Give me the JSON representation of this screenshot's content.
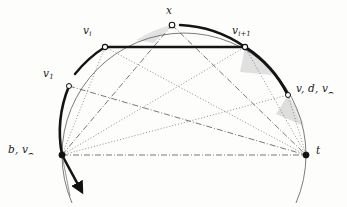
{
  "figure": {
    "kind": "geometric-diagram",
    "colors": {
      "stroke": "#1b1b1b",
      "thin_arc": "#4a4a4a",
      "bold_path": "#111111",
      "dotted_line": "#555555",
      "dashdot_line": "#3c3c3c",
      "shade_fill": "#d9d9d9",
      "background": "#fdfdfc"
    },
    "labels": [
      {
        "id": "x",
        "text": "x",
        "sub": "",
        "x": 170,
        "y": 6,
        "anchor": "center"
      },
      {
        "id": "vi",
        "text": "v",
        "sub": "i",
        "x": 88,
        "y": 27,
        "anchor": "center"
      },
      {
        "id": "vi1",
        "text": "v",
        "sub": "i+1",
        "x": 240,
        "y": 27,
        "anchor": "center"
      },
      {
        "id": "v1",
        "text": "v",
        "sub": "1",
        "x": 48,
        "y": 70,
        "anchor": "center"
      },
      {
        "id": "vdv",
        "text": "v, d, v",
        "sub": "cap",
        "x": 296,
        "y": 85,
        "anchor": "left"
      },
      {
        "id": "bv",
        "text": "b, v",
        "sub": "cap",
        "x": 8,
        "y": 146,
        "anchor": "left"
      },
      {
        "id": "t",
        "text": "t",
        "sub": "",
        "x": 317,
        "y": 146,
        "anchor": "left"
      }
    ],
    "label_text": {
      "x": "x",
      "vi": "v",
      "vi_sub": "i",
      "vi1": "v",
      "vi1_sub": "i+1",
      "v1": "v",
      "v1_sub": "1",
      "vdv": "v, d, v",
      "vdv_sub": "⌢",
      "bv": "b, v",
      "bv_sub": "⌢",
      "t": "t"
    },
    "points": {
      "b": {
        "x": 62,
        "y": 155,
        "marker": "filled"
      },
      "t": {
        "x": 306,
        "y": 155,
        "marker": "filled"
      },
      "v1": {
        "x": 69,
        "y": 86,
        "marker": "open"
      },
      "vi": {
        "x": 105,
        "y": 47,
        "marker": "open"
      },
      "x": {
        "x": 172,
        "y": 25,
        "marker": "open"
      },
      "vi1": {
        "x": 245,
        "y": 47,
        "marker": "open"
      },
      "vdv": {
        "x": 288,
        "y": 95,
        "marker": "open"
      }
    },
    "circle": {
      "cx": 184,
      "cy": 155,
      "r": 122
    },
    "segments": [
      {
        "name": "chord-vi-vi1",
        "from": "vi",
        "to": "vi1",
        "style": "solid-bold"
      },
      {
        "name": "baseline-b-t",
        "from": "b",
        "to": "t",
        "style": "dashdot"
      },
      {
        "name": "b-to-x",
        "from": "b",
        "to": "x",
        "style": "dashdot"
      },
      {
        "name": "b-to-vi1",
        "from": "b",
        "to": "vi1",
        "style": "dotted"
      },
      {
        "name": "b-to-vdv",
        "from": "b",
        "to": "vdv",
        "style": "dotted"
      },
      {
        "name": "v1-to-t",
        "from": "v1",
        "to": "t",
        "style": "dashdot"
      },
      {
        "name": "vi-to-t",
        "from": "vi",
        "to": "t",
        "style": "dotted"
      },
      {
        "name": "x-to-t",
        "from": "x",
        "to": "t",
        "style": "dashdot"
      },
      {
        "name": "vi1-to-t",
        "from": "vi1",
        "to": "t",
        "style": "dotted"
      },
      {
        "name": "vdv-to-t",
        "from": "vdv",
        "to": "t",
        "style": "dotted"
      }
    ],
    "shaded_regions": [
      {
        "name": "wedge-near-x-left",
        "description": "gray wedge between chord and arc left of x"
      },
      {
        "name": "wedge-below-vi1",
        "description": "gray wedge below vi+1 toward t"
      },
      {
        "name": "wedge-near-vdv",
        "description": "gray wedge near v,d,v point"
      }
    ],
    "bold_arcs": [
      {
        "name": "arc-b-to-v1",
        "description": "bold arc from b up to v1"
      },
      {
        "name": "arc-v1-to-vi",
        "description": "bold arc from v1 up to vi"
      },
      {
        "name": "arc-x-to-vi1",
        "description": "bold arc from x down to vi+1"
      },
      {
        "name": "arc-vi1-to-vdv",
        "description": "bold arc from vi+1 down to v,d,v"
      }
    ],
    "arrow": {
      "name": "bold-arrow-below-b",
      "description": "bold arrow extending below b"
    }
  }
}
